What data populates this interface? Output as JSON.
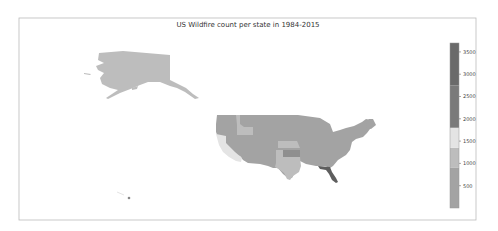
{
  "chart_data": {
    "type": "choropleth-map",
    "title": "US Wildfire count per state in 1984-2015",
    "xlabel": "",
    "ylabel": "",
    "colorbar": {
      "range": [
        0,
        3700
      ],
      "ticks": [
        500,
        1000,
        1500,
        2000,
        2500,
        3000,
        3500
      ],
      "tick_labels": [
        "500",
        "1000",
        "1500",
        "2000",
        "2500",
        "3000",
        "3500"
      ],
      "bands": [
        {
          "from": 0,
          "to": 900,
          "color": "#a3a3a3"
        },
        {
          "from": 900,
          "to": 1350,
          "color": "#bdbdbd"
        },
        {
          "from": 1350,
          "to": 1800,
          "color": "#e4e4e4"
        },
        {
          "from": 1800,
          "to": 2750,
          "color": "#7a7a7a"
        },
        {
          "from": 2750,
          "to": 3700,
          "color": "#6a6a6a"
        }
      ]
    },
    "regions": [
      {
        "name": "Alaska",
        "band": 0
      },
      {
        "name": "Hawaii",
        "band": 0
      },
      {
        "name": "Contiguous US (most states)",
        "band": 0
      },
      {
        "name": "Idaho",
        "band": 1
      },
      {
        "name": "Nebraska",
        "band": 1
      },
      {
        "name": "New Mexico",
        "band": 1
      },
      {
        "name": "Texas",
        "band": 1
      },
      {
        "name": "California",
        "band": 2
      },
      {
        "name": "Kansas",
        "band": 0
      },
      {
        "name": "Florida",
        "band": 4
      }
    ]
  }
}
